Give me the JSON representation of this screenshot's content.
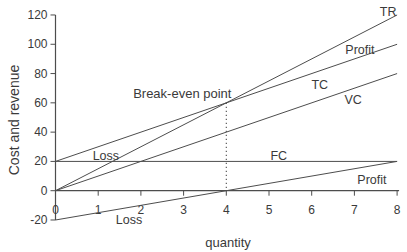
{
  "chart_data": {
    "type": "line",
    "title": "",
    "xlabel": "quantity",
    "ylabel": "Cost and revenue",
    "xlim": [
      0,
      8
    ],
    "ylim": [
      -20,
      120
    ],
    "x_ticks": [
      0,
      1,
      2,
      3,
      4,
      5,
      6,
      7,
      8
    ],
    "y_ticks": [
      120,
      100,
      80,
      60,
      40,
      20,
      0,
      -20
    ],
    "grid": false,
    "legend_position": "none",
    "series": [
      {
        "name": "TR",
        "x": [
          0,
          8
        ],
        "values": [
          0,
          120
        ]
      },
      {
        "name": "TC",
        "x": [
          0,
          8
        ],
        "values": [
          20,
          100
        ]
      },
      {
        "name": "VC",
        "x": [
          0,
          8
        ],
        "values": [
          0,
          80
        ]
      },
      {
        "name": "FC",
        "x": [
          0,
          8
        ],
        "values": [
          20,
          20
        ]
      },
      {
        "name": "Profit",
        "x": [
          0,
          8
        ],
        "values": [
          -20,
          20
        ]
      }
    ],
    "line_labels": [
      {
        "text": "TR",
        "x": 7.79,
        "y": 119.3,
        "anchor": "middle"
      },
      {
        "text": "Profit",
        "x": 7.13,
        "y": 93.4,
        "anchor": "middle"
      },
      {
        "text": "TC",
        "x": 6.19,
        "y": 69.4,
        "anchor": "middle"
      },
      {
        "text": "VC",
        "x": 6.97,
        "y": 59.2,
        "anchor": "middle"
      },
      {
        "text": "FC",
        "x": 5.23,
        "y": 21.0,
        "anchor": "middle"
      },
      {
        "text": "Profit",
        "x": 7.41,
        "y": 4.6,
        "anchor": "middle"
      },
      {
        "text": "Loss",
        "x": 1.18,
        "y": 21.0,
        "anchor": "middle"
      },
      {
        "text": "Loss",
        "x": 1.72,
        "y": -22.7,
        "anchor": "middle"
      }
    ],
    "annotation": {
      "text": "Break-even point",
      "x": 4.12,
      "y": 63,
      "anchor": "end"
    },
    "break_even_marker": {
      "x": 4,
      "y_top": 60,
      "y_bottom": 0,
      "style": "dotted"
    }
  },
  "colors": {
    "background": "#ffffff",
    "line": "#4d4d4d",
    "text": "#3a3a3a"
  }
}
